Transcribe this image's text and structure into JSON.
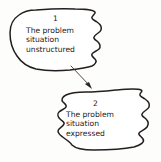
{
  "diagram": {
    "background_color": "#fdfdfc",
    "ink_color": "#241f1c",
    "nodes": [
      {
        "id": "node-1",
        "number": "1",
        "shape": "cloud",
        "lines": [
          "The problem",
          "situation",
          "unstructured"
        ]
      },
      {
        "id": "node-2",
        "number": "2",
        "shape": "cloud",
        "lines": [
          "The problem",
          "situation",
          "expressed"
        ]
      }
    ],
    "connector": {
      "name": "arrow-node1-to-node2",
      "from": "node-1",
      "to": "node-2",
      "style": "solid-arrow"
    }
  }
}
